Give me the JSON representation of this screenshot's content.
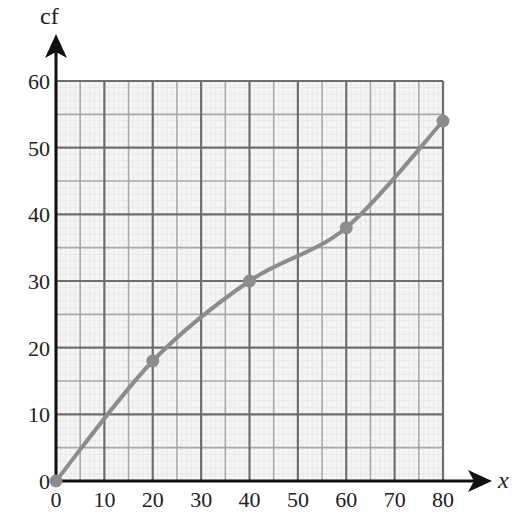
{
  "chart_data": {
    "type": "line",
    "title": "",
    "xlabel": "x",
    "ylabel": "cf",
    "xlim": [
      0,
      80
    ],
    "ylim": [
      0,
      60
    ],
    "x_ticks": [
      "0",
      "10",
      "20",
      "30",
      "40",
      "50",
      "60",
      "70",
      "80"
    ],
    "y_ticks": [
      "0",
      "10",
      "20",
      "30",
      "40",
      "50",
      "60"
    ],
    "grid": true,
    "legend": null,
    "series": [
      {
        "name": "cumulative frequency",
        "x": [
          0,
          20,
          40,
          60,
          80
        ],
        "values": [
          0,
          18,
          30,
          38,
          54
        ],
        "marker": "circle",
        "smooth": true
      }
    ]
  },
  "colors": {
    "curve": "#8c8c8c",
    "major_grid": "#6e6e6e",
    "minor_grid": "#a8a8a8",
    "fine_grid": "#e2e2e2",
    "grid_bg": "#f5f5f5",
    "axis": "#111111"
  }
}
